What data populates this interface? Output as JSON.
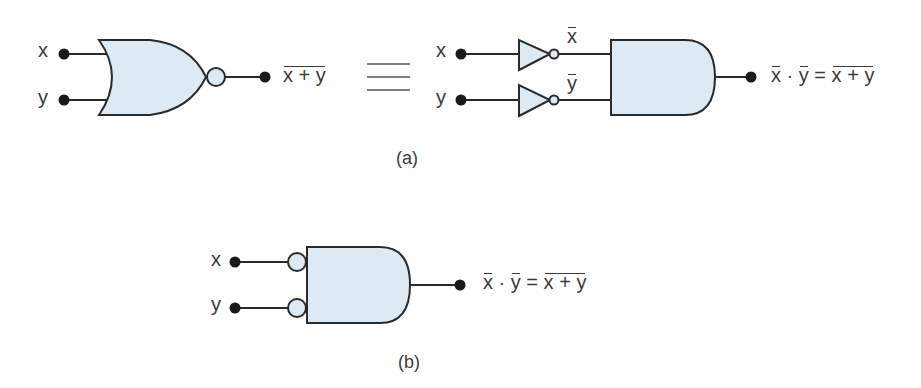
{
  "figure": {
    "part_a": {
      "caption": "(a)",
      "nor_gate": {
        "inputs": [
          "x",
          "y"
        ],
        "output_label": "x + y",
        "output_negated": true
      },
      "equivalence_symbol": "≡",
      "equivalent_circuit": {
        "inputs": [
          "x",
          "y"
        ],
        "inverter_outputs": [
          "x",
          "y"
        ],
        "output_lhs_vars": [
          "x",
          "y"
        ],
        "output_operator": "·",
        "equals": "=",
        "output_rhs": "x + y"
      }
    },
    "part_b": {
      "caption": "(b)",
      "bubbled_and_gate": {
        "inputs": [
          "x",
          "y"
        ],
        "output_lhs_vars": [
          "x",
          "y"
        ],
        "output_operator": "·",
        "equals": "=",
        "output_rhs": "x + y"
      }
    },
    "colors": {
      "gate_fill": "#dde9f3",
      "stroke": "#2a2a2a",
      "terminal": "#1a1a1a",
      "text": "#3a3a3a"
    }
  }
}
